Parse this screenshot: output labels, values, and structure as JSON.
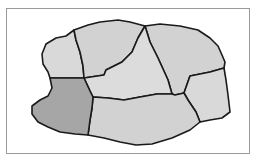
{
  "diagram": {
    "type": "region-map",
    "regions": [
      {
        "id": "west-upper",
        "highlighted": false,
        "fill": "#d9d9d9"
      },
      {
        "id": "north-center",
        "highlighted": false,
        "fill": "#d2d2d2"
      },
      {
        "id": "north-east",
        "highlighted": false,
        "fill": "#d2d2d2"
      },
      {
        "id": "center",
        "highlighted": false,
        "fill": "#dcdcdc"
      },
      {
        "id": "east",
        "highlighted": false,
        "fill": "#d9d9d9"
      },
      {
        "id": "south-center",
        "highlighted": false,
        "fill": "#d2d2d2"
      },
      {
        "id": "west-lower",
        "highlighted": true,
        "fill": "#a6a6a6"
      }
    ],
    "colors": {
      "border": "#1a1a1a",
      "frame": "#9a9a9a",
      "highlight": "#a6a6a6",
      "base": "#d6d6d6"
    }
  }
}
